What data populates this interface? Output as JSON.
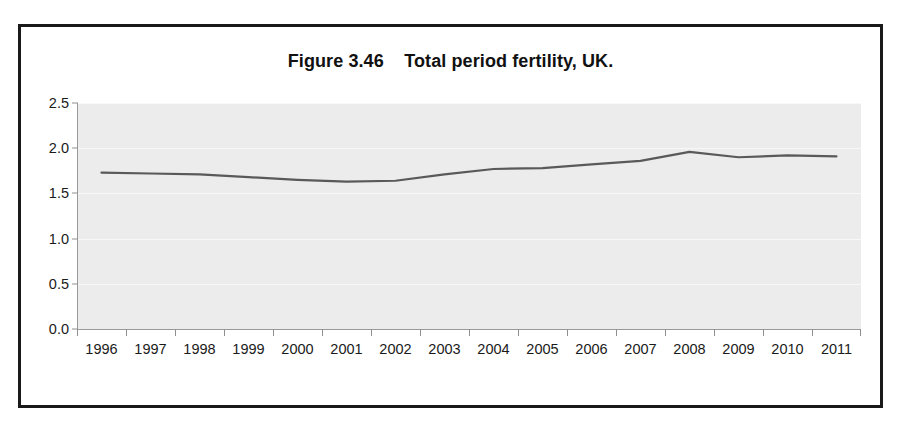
{
  "figure": {
    "title": "Figure 3.46    Total period fertility, UK.",
    "border_color": "#1a1a1a",
    "background_color": "#ffffff"
  },
  "chart_data": {
    "type": "line",
    "title": "Figure 3.46    Total period fertility, UK.",
    "xlabel": "",
    "ylabel": "",
    "categories": [
      "1996",
      "1997",
      "1998",
      "1999",
      "2000",
      "2001",
      "2002",
      "2003",
      "2004",
      "2005",
      "2006",
      "2007",
      "2008",
      "2009",
      "2010",
      "2011"
    ],
    "values": [
      1.73,
      1.72,
      1.71,
      1.68,
      1.65,
      1.63,
      1.64,
      1.71,
      1.77,
      1.78,
      1.82,
      1.86,
      1.96,
      1.9,
      1.92,
      1.91
    ],
    "series": [
      {
        "name": "Total period fertility rate",
        "color": "#595959",
        "values": [
          1.73,
          1.72,
          1.71,
          1.68,
          1.65,
          1.63,
          1.64,
          1.71,
          1.77,
          1.78,
          1.82,
          1.86,
          1.96,
          1.9,
          1.92,
          1.91
        ]
      }
    ],
    "ylim": [
      0.0,
      2.5
    ],
    "yticks": [
      "0.0",
      "0.5",
      "1.0",
      "1.5",
      "2.0",
      "2.5"
    ],
    "ytick_values": [
      0.0,
      0.5,
      1.0,
      1.5,
      2.0,
      2.5
    ],
    "grid": true,
    "grid_color": "#f8f8f8",
    "plot_background": "#ececec",
    "legend": "none",
    "legend_position": "none",
    "line_color": "#595959",
    "line_width": 2.2,
    "markers": false
  }
}
